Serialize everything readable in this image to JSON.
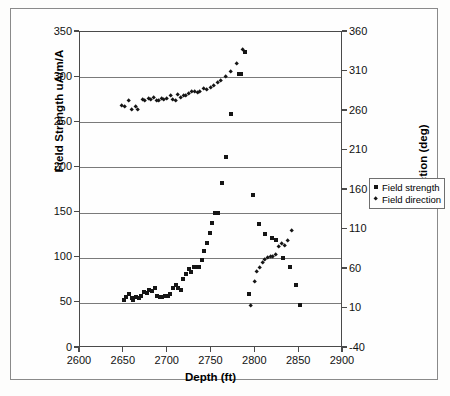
{
  "chart_data": {
    "type": "scatter",
    "title": "",
    "xlabel": "Depth (ft)",
    "ylabel": "Field Strength uA/m/A",
    "y2label": "Direction (deg)",
    "xlim": [
      2600,
      2900
    ],
    "xticks": [
      "2600",
      "2650",
      "2700",
      "2750",
      "2800",
      "2850",
      "2900"
    ],
    "ylim": [
      0,
      350
    ],
    "yticks": [
      "0",
      "50",
      "100",
      "150",
      "200",
      "250",
      "300",
      "350"
    ],
    "y2lim": [
      -40,
      360
    ],
    "y2ticks": [
      "-40",
      "10",
      "60",
      "110",
      "160",
      "210",
      "260",
      "310",
      "360"
    ],
    "grid": "horizontal",
    "legend_position": "right-outside",
    "series": [
      {
        "name": "Field strength",
        "marker": "square",
        "axis": "left",
        "color": "#151515",
        "points": [
          [
            2650,
            53
          ],
          [
            2653,
            56
          ],
          [
            2656,
            60
          ],
          [
            2659,
            55
          ],
          [
            2661,
            53
          ],
          [
            2664,
            57
          ],
          [
            2667,
            55
          ],
          [
            2670,
            58
          ],
          [
            2673,
            62
          ],
          [
            2676,
            61
          ],
          [
            2679,
            64
          ],
          [
            2682,
            63
          ],
          [
            2685,
            66
          ],
          [
            2688,
            58
          ],
          [
            2691,
            57
          ],
          [
            2694,
            57
          ],
          [
            2697,
            58
          ],
          [
            2700,
            58
          ],
          [
            2703,
            60
          ],
          [
            2706,
            66
          ],
          [
            2709,
            70
          ],
          [
            2712,
            67
          ],
          [
            2715,
            64
          ],
          [
            2718,
            76
          ],
          [
            2721,
            82
          ],
          [
            2724,
            87
          ],
          [
            2727,
            84
          ],
          [
            2730,
            90
          ],
          [
            2733,
            90
          ],
          [
            2736,
            90
          ],
          [
            2739,
            97
          ],
          [
            2742,
            107
          ],
          [
            2745,
            116
          ],
          [
            2748,
            127
          ],
          [
            2751,
            139
          ],
          [
            2754,
            150
          ],
          [
            2757,
            150
          ],
          [
            2762,
            183
          ],
          [
            2766,
            211
          ],
          [
            2772,
            259
          ],
          [
            2781,
            304
          ],
          [
            2784,
            304
          ],
          [
            2788,
            328
          ],
          [
            2793,
            60
          ],
          [
            2797,
            170
          ],
          [
            2804,
            137
          ],
          [
            2811,
            126
          ],
          [
            2819,
            122
          ],
          [
            2824,
            120
          ],
          [
            2831,
            100
          ],
          [
            2839,
            90
          ],
          [
            2846,
            70
          ],
          [
            2851,
            48
          ]
        ]
      },
      {
        "name": "Field direction",
        "marker": "diamond",
        "axis": "right",
        "color": "#151515",
        "points": [
          [
            2648,
            267
          ],
          [
            2651,
            266
          ],
          [
            2656,
            273
          ],
          [
            2659,
            262
          ],
          [
            2663,
            266
          ],
          [
            2666,
            262
          ],
          [
            2671,
            274
          ],
          [
            2674,
            273
          ],
          [
            2678,
            276
          ],
          [
            2681,
            274
          ],
          [
            2684,
            277
          ],
          [
            2687,
            273
          ],
          [
            2690,
            273
          ],
          [
            2693,
            275
          ],
          [
            2696,
            274
          ],
          [
            2699,
            275
          ],
          [
            2703,
            279
          ],
          [
            2706,
            274
          ],
          [
            2709,
            273
          ],
          [
            2712,
            281
          ],
          [
            2715,
            277
          ],
          [
            2718,
            280
          ],
          [
            2721,
            280
          ],
          [
            2724,
            282
          ],
          [
            2727,
            285
          ],
          [
            2731,
            284
          ],
          [
            2734,
            283
          ],
          [
            2737,
            285
          ],
          [
            2741,
            288
          ],
          [
            2745,
            287
          ],
          [
            2749,
            290
          ],
          [
            2753,
            292
          ],
          [
            2757,
            296
          ],
          [
            2761,
            299
          ],
          [
            2766,
            303
          ],
          [
            2772,
            310
          ],
          [
            2779,
            320
          ],
          [
            2786,
            338
          ],
          [
            2795,
            14
          ],
          [
            2799,
            44
          ],
          [
            2802,
            56
          ],
          [
            2805,
            62
          ],
          [
            2808,
            68
          ],
          [
            2811,
            72
          ],
          [
            2814,
            74
          ],
          [
            2817,
            75
          ],
          [
            2820,
            76
          ],
          [
            2823,
            78
          ],
          [
            2827,
            88
          ],
          [
            2830,
            92
          ],
          [
            2834,
            90
          ],
          [
            2837,
            96
          ],
          [
            2841,
            108
          ]
        ]
      }
    ]
  },
  "axes": {
    "left_title": "Field Strength uA/m/A",
    "right_title": "Direction (deg)",
    "bottom_title": "Depth (ft)"
  },
  "legend": {
    "items": [
      {
        "label": "Field strength",
        "marker": "square-marker"
      },
      {
        "label": "Field direction",
        "marker": "diamond-marker"
      }
    ]
  }
}
